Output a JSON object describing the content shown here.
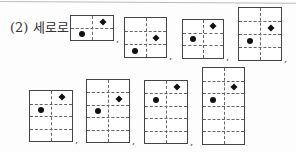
{
  "problem": {
    "label": "(2) 세로로",
    "separator": ",",
    "grids": [
      {
        "x": 70,
        "y": 15,
        "w": 44,
        "h": 26,
        "rows": 2,
        "diamond": {
          "row": 1,
          "col": 2
        },
        "dot": {
          "row": 2,
          "col": 1
        },
        "comma": true
      },
      {
        "x": 124,
        "y": 17,
        "w": 43,
        "h": 41,
        "rows": 3,
        "diamond": {
          "row": 2,
          "col": 2
        },
        "dot": {
          "row": 3,
          "col": 1
        },
        "comma": true
      },
      {
        "x": 182,
        "y": 19,
        "w": 42,
        "h": 40,
        "rows": 3,
        "diamond": {
          "row": 1,
          "col": 2
        },
        "dot": {
          "row": 2,
          "col": 1
        },
        "comma": true
      },
      {
        "x": 238,
        "y": 7,
        "w": 44,
        "h": 54,
        "rows": 4,
        "diamond": {
          "row": 2,
          "col": 2
        },
        "dot": {
          "row": 3,
          "col": 1
        },
        "comma": true
      },
      {
        "x": 29,
        "y": 90,
        "w": 44,
        "h": 52,
        "rows": 4,
        "diamond": {
          "row": 1,
          "col": 2
        },
        "dot": {
          "row": 2,
          "col": 1
        },
        "comma": true
      },
      {
        "x": 86,
        "y": 79,
        "w": 44,
        "h": 64,
        "rows": 5,
        "diamond": {
          "row": 2,
          "col": 2
        },
        "dot": {
          "row": 3,
          "col": 1
        },
        "comma": true
      },
      {
        "x": 144,
        "y": 80,
        "w": 44,
        "h": 64,
        "rows": 5,
        "diamond": {
          "row": 1,
          "col": 2
        },
        "dot": {
          "row": 2,
          "col": 1
        },
        "comma": true
      },
      {
        "x": 202,
        "y": 67,
        "w": 43,
        "h": 78,
        "rows": 6,
        "diamond": {
          "row": 2,
          "col": 2
        },
        "dot": {
          "row": 3,
          "col": 1
        },
        "comma": false
      }
    ]
  }
}
